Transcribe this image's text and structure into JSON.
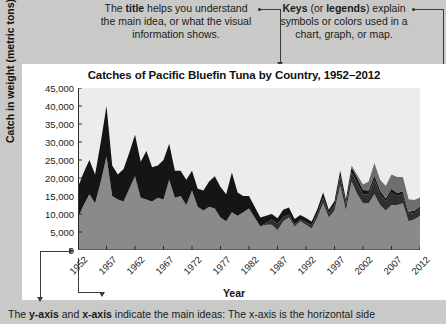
{
  "annotations": {
    "title_note": "The title helps you understand the main idea, or what the visual information shows.",
    "title_note_bold": "title",
    "keys_note": "Keys (or legends) explain symbols or colors used in a chart, graph, or map.",
    "keys_note_bold_1": "Keys",
    "keys_note_bold_2": "legends",
    "bottom_caption": "The y-axis and x-axis indicate the main ideas: The x-axis is the horizontal side",
    "bottom_caption_bold_1": "y-axis",
    "bottom_caption_bold_2": "x-axis"
  },
  "chart_data": {
    "type": "area",
    "stacked": true,
    "title": "Catches of Pacific Bluefin Tuna by Country, 1952–2012",
    "xlabel": "Year",
    "ylabel": "Catch in weight (metric tons)",
    "ylim": [
      0,
      45000
    ],
    "yticks": [
      0,
      5000,
      10000,
      15000,
      20000,
      25000,
      30000,
      35000,
      40000,
      45000
    ],
    "ytick_labels": [
      "0",
      "5,000",
      "10,000",
      "15,000",
      "20,000",
      "25,000",
      "30,000",
      "35,000",
      "40,000",
      "45,000"
    ],
    "xticks": [
      1952,
      1957,
      1962,
      1967,
      1972,
      1977,
      1982,
      1987,
      1992,
      1997,
      2002,
      2007,
      2012
    ],
    "xtick_labels": [
      "1952",
      "1957",
      "1962",
      "1967",
      "1972",
      "1977",
      "1982",
      "1987",
      "1992",
      "1997",
      "2002",
      "2007",
      "2012"
    ],
    "xlim": [
      1952,
      2012
    ],
    "grid": false,
    "legend_position": "top",
    "colors": {
      "Mexico": "#6e6e6e",
      "United States": "#151515",
      "Korea": "#2f2f2f",
      "Japan": "#8a8a8a",
      "Others": "#a9a9a9",
      "plot_background": "#ececeb"
    },
    "x": [
      1952,
      1953,
      1954,
      1955,
      1956,
      1957,
      1958,
      1959,
      1960,
      1961,
      1962,
      1963,
      1964,
      1965,
      1966,
      1967,
      1968,
      1969,
      1970,
      1971,
      1972,
      1973,
      1974,
      1975,
      1976,
      1977,
      1978,
      1979,
      1980,
      1981,
      1982,
      1983,
      1984,
      1985,
      1986,
      1987,
      1988,
      1989,
      1990,
      1991,
      1992,
      1993,
      1994,
      1995,
      1996,
      1997,
      1998,
      1999,
      2000,
      2001,
      2002,
      2003,
      2004,
      2005,
      2006,
      2007,
      2008,
      2009,
      2010,
      2011,
      2012
    ],
    "series": [
      {
        "name": "Japan",
        "values": [
          9000,
          12500,
          15500,
          13000,
          19000,
          26000,
          15000,
          14000,
          13500,
          17000,
          20500,
          14500,
          14000,
          13500,
          14500,
          14000,
          19500,
          14500,
          15000,
          12500,
          16500,
          12000,
          11000,
          12000,
          11500,
          9000,
          8000,
          10500,
          9500,
          10500,
          11500,
          9000,
          6500,
          7000,
          7000,
          5500,
          8000,
          9000,
          6500,
          8000,
          7000,
          6000,
          9000,
          13000,
          9000,
          11000,
          18000,
          11000,
          19000,
          15500,
          13000,
          13000,
          15500,
          12500,
          11000,
          12500,
          12500,
          13000,
          8000,
          8500,
          9500
        ]
      },
      {
        "name": "Korea",
        "values": [
          0,
          0,
          0,
          0,
          0,
          0,
          0,
          0,
          0,
          0,
          0,
          0,
          0,
          0,
          0,
          0,
          0,
          0,
          0,
          0,
          0,
          0,
          0,
          0,
          0,
          0,
          0,
          0,
          0,
          0,
          0,
          0,
          0,
          500,
          1500,
          1800,
          1200,
          800,
          600,
          500,
          700,
          900,
          1200,
          1500,
          1200,
          1400,
          2500,
          1800,
          2500,
          3000,
          2500,
          2500,
          4000,
          3000,
          2500,
          3500,
          2500,
          2500,
          2000,
          1800,
          2000
        ]
      },
      {
        "name": "United States",
        "values": [
          8500,
          9000,
          9500,
          8000,
          11000,
          14000,
          8500,
          7000,
          9000,
          10000,
          11500,
          10000,
          13500,
          9500,
          9000,
          11000,
          10000,
          7500,
          7000,
          7000,
          5500,
          5000,
          5500,
          7000,
          9000,
          8500,
          7500,
          11000,
          6500,
          4500,
          3500,
          3000,
          2500,
          2000,
          1500,
          1500,
          2000,
          2000,
          1500,
          1200,
          1200,
          1000,
          1200,
          1500,
          1000,
          1200,
          1500,
          1200,
          1500,
          1500,
          1200,
          1000,
          1200,
          1000,
          800,
          1000,
          800,
          800,
          600,
          600,
          600
        ]
      },
      {
        "name": "Mexico",
        "values": [
          0,
          0,
          0,
          0,
          0,
          0,
          0,
          0,
          0,
          0,
          0,
          0,
          0,
          0,
          0,
          0,
          0,
          0,
          0,
          0,
          0,
          0,
          0,
          0,
          0,
          0,
          0,
          0,
          0,
          0,
          0,
          0,
          0,
          0,
          0,
          0,
          0,
          0,
          0,
          0,
          0,
          0,
          0,
          0,
          0,
          0,
          0,
          0,
          500,
          800,
          1500,
          2500,
          3500,
          3000,
          3500,
          4000,
          4500,
          4000,
          3500,
          3000,
          2500
        ]
      },
      {
        "name": "Others",
        "values": [
          0,
          0,
          0,
          0,
          0,
          0,
          0,
          0,
          0,
          0,
          0,
          0,
          0,
          0,
          0,
          0,
          0,
          0,
          0,
          0,
          0,
          0,
          0,
          0,
          0,
          0,
          0,
          0,
          0,
          0,
          0,
          0,
          0,
          0,
          0,
          0,
          0,
          0,
          0,
          0,
          0,
          0,
          0,
          0,
          0,
          0,
          0,
          0,
          0,
          0,
          0,
          0,
          0,
          0,
          0,
          0,
          0,
          0,
          0,
          0,
          0
        ]
      }
    ],
    "legend": [
      {
        "label": "Mexico",
        "color": "#6e6e6e"
      },
      {
        "label": "United States",
        "color": "#151515"
      },
      {
        "label": "Korea",
        "color": "#2f2f2f"
      },
      {
        "label": "Japan",
        "color": "#8a8a8a"
      },
      {
        "label": "Others",
        "color": "#a9a9a9"
      }
    ]
  }
}
